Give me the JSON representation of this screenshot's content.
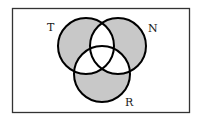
{
  "diagram": {
    "type": "venn",
    "universe": {
      "x": 12,
      "y": 8,
      "width": 178,
      "height": 105
    },
    "sets": [
      {
        "label": "T",
        "cx": 86,
        "cy": 46,
        "r": 28,
        "label_x": 51,
        "label_y": 31
      },
      {
        "label": "N",
        "cx": 118,
        "cy": 46,
        "r": 28,
        "label_x": 148,
        "label_y": 32
      },
      {
        "label": "R",
        "cx": 102,
        "cy": 74,
        "r": 28,
        "label_x": 125,
        "label_y": 106
      }
    ],
    "shaded_region": "exactly one set (T only, N only, R only)",
    "colors": {
      "shade": "#c8c8c8",
      "stroke": "#000000",
      "background": "#ffffff",
      "frame": "#333333"
    }
  }
}
